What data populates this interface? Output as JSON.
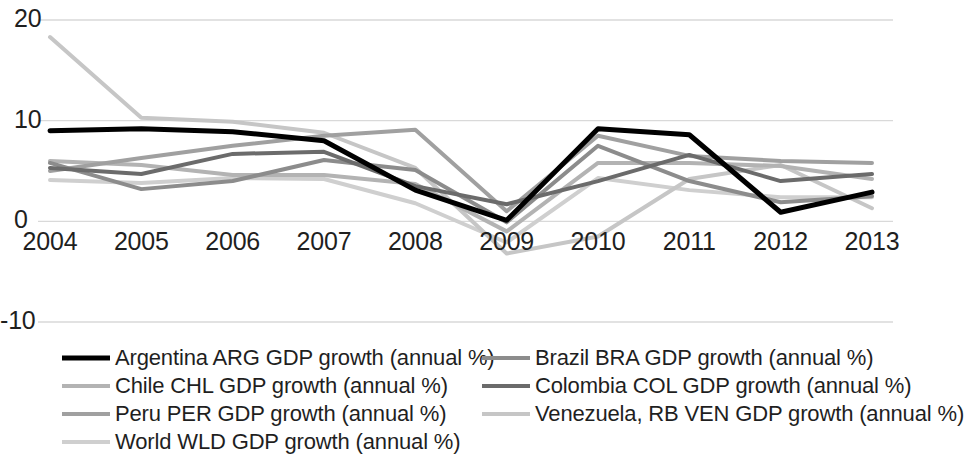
{
  "chart_data": {
    "type": "line",
    "title": "",
    "xlabel": "",
    "ylabel": "",
    "categories": [
      "2004",
      "2005",
      "2006",
      "2007",
      "2008",
      "2009",
      "2010",
      "2011",
      "2012",
      "2013"
    ],
    "x": [
      2004,
      2005,
      2006,
      2007,
      2008,
      2009,
      2010,
      2011,
      2012,
      2013
    ],
    "ylim": [
      -10,
      20
    ],
    "yticks": [
      20,
      10,
      0,
      -10
    ],
    "ytick_labels": [
      "20",
      "10",
      "0",
      "-10"
    ],
    "grid": true,
    "grid_axis": "y",
    "legend_position": "bottom",
    "legend_columns": 2,
    "series": [
      {
        "name": "Argentina ARG GDP growth (annual %)",
        "color": "#000000",
        "width": 5,
        "values": [
          9.0,
          9.2,
          8.9,
          8.0,
          3.1,
          0.1,
          9.2,
          8.6,
          0.9,
          2.9
        ]
      },
      {
        "name": "Brazil BRA GDP growth (annual %)",
        "color": "#8c8c8c",
        "width": 4,
        "values": [
          5.8,
          3.2,
          4.0,
          6.1,
          5.1,
          -0.1,
          7.5,
          4.0,
          1.9,
          2.5
        ]
      },
      {
        "name": "Chile CHL GDP growth (annual %)",
        "color": "#b3b3b3",
        "width": 4,
        "values": [
          6.0,
          5.6,
          4.6,
          4.6,
          3.7,
          -1.0,
          5.8,
          5.8,
          5.5,
          4.2
        ]
      },
      {
        "name": "Colombia COL GDP growth (annual %)",
        "color": "#6b6b6b",
        "width": 4,
        "values": [
          5.3,
          4.7,
          6.7,
          6.9,
          3.5,
          1.7,
          4.0,
          6.6,
          4.0,
          4.7
        ]
      },
      {
        "name": "Peru PER GDP growth (annual %)",
        "color": "#a0a0a0",
        "width": 4,
        "values": [
          5.0,
          6.3,
          7.5,
          8.5,
          9.1,
          1.0,
          8.5,
          6.5,
          6.0,
          5.8
        ]
      },
      {
        "name": "Venezuela, RB VEN GDP growth (annual %)",
        "color": "#c6c6c6",
        "width": 4,
        "values": [
          18.3,
          10.3,
          9.9,
          8.8,
          5.3,
          -3.2,
          -1.5,
          4.2,
          5.6,
          1.3
        ]
      },
      {
        "name": "World WLD GDP growth (annual %)",
        "color": "#cfcfcf",
        "width": 4,
        "values": [
          4.1,
          3.8,
          4.3,
          4.2,
          1.8,
          -2.1,
          4.3,
          3.1,
          2.4,
          2.4
        ]
      }
    ]
  },
  "axis": {
    "y_labels": [
      "20",
      "10",
      "0",
      "-10"
    ],
    "x_labels": [
      "2004",
      "2005",
      "2006",
      "2007",
      "2008",
      "2009",
      "2010",
      "2011",
      "2012",
      "2013"
    ]
  },
  "legend": {
    "items": [
      {
        "label": "Argentina ARG GDP growth (annual %)",
        "color": "#000000",
        "width": 5
      },
      {
        "label": "Brazil BRA GDP growth (annual %)",
        "color": "#8c8c8c",
        "width": 4
      },
      {
        "label": "Chile CHL GDP growth (annual %)",
        "color": "#b3b3b3",
        "width": 4
      },
      {
        "label": "Colombia COL GDP growth (annual %)",
        "color": "#6b6b6b",
        "width": 4
      },
      {
        "label": "Peru PER GDP growth (annual %)",
        "color": "#a0a0a0",
        "width": 4
      },
      {
        "label": "Venezuela, RB VEN GDP growth (annual %)",
        "color": "#c6c6c6",
        "width": 4
      },
      {
        "label": "World WLD GDP growth (annual %)",
        "color": "#cfcfcf",
        "width": 4
      }
    ]
  },
  "style": {
    "gridline_color": "#d9d9d9",
    "text_color": "#1f1f1f",
    "background": "#ffffff"
  }
}
